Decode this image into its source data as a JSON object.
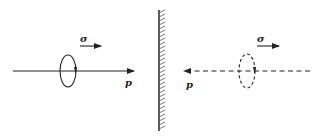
{
  "diagram": {
    "left_panel": {
      "momentum_label": "p",
      "spin_label": "σ",
      "line_style": "solid",
      "momentum_direction": "right",
      "spin_direction": "right"
    },
    "mirror": {
      "type": "hatched-wall"
    },
    "right_panel": {
      "momentum_label": "p",
      "spin_label": "σ",
      "line_style": "dashed",
      "momentum_direction": "left",
      "spin_direction": "right"
    },
    "colors": {
      "stroke": "#222222",
      "background": "#ffffff"
    }
  }
}
